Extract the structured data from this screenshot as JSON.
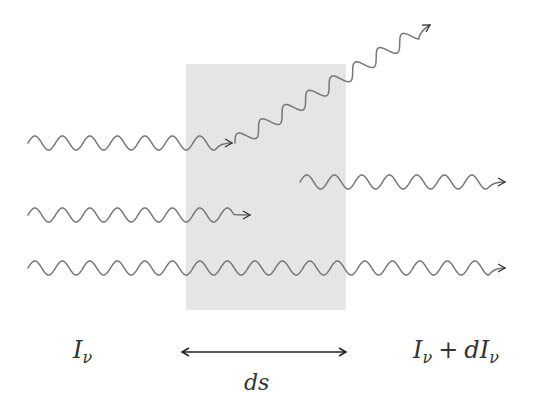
{
  "diagram": {
    "medium": {
      "x": 186,
      "y": 64,
      "width": 160,
      "height": 246,
      "fill": "#e6e6e6"
    },
    "colors": {
      "wave": "#777777",
      "wave_inside": "#555555",
      "arrow": "#222222",
      "text": "#333333"
    },
    "rays": [
      {
        "id": "absorbed-ray",
        "from": [
          28,
          143
        ],
        "to": [
          232,
          143
        ],
        "description": "Incoming ray that is scattered"
      },
      {
        "id": "scattered-ray",
        "from": [
          235,
          143
        ],
        "to": [
          430,
          25
        ],
        "description": "Scattered ray leaving upward"
      },
      {
        "id": "emitted-ray",
        "from": [
          300,
          182
        ],
        "to": [
          505,
          182
        ],
        "description": "Ray emitted inside the medium"
      },
      {
        "id": "absorbed-ray-2",
        "from": [
          28,
          215
        ],
        "to": [
          250,
          215
        ],
        "description": "Ray absorbed inside the medium"
      },
      {
        "id": "transmitted-ray",
        "from": [
          28,
          268
        ],
        "to": [
          505,
          268
        ],
        "description": "Ray transmitted through the medium"
      }
    ],
    "labels": {
      "incoming": {
        "base": "I",
        "sub": "ν"
      },
      "outgoing": {
        "base": "I",
        "sub": "ν",
        "op": "+",
        "d": "dI",
        "sub2": "ν"
      },
      "thickness": "ds"
    },
    "span_arrow": {
      "from": [
        180,
        352
      ],
      "to": [
        346,
        352
      ]
    }
  }
}
